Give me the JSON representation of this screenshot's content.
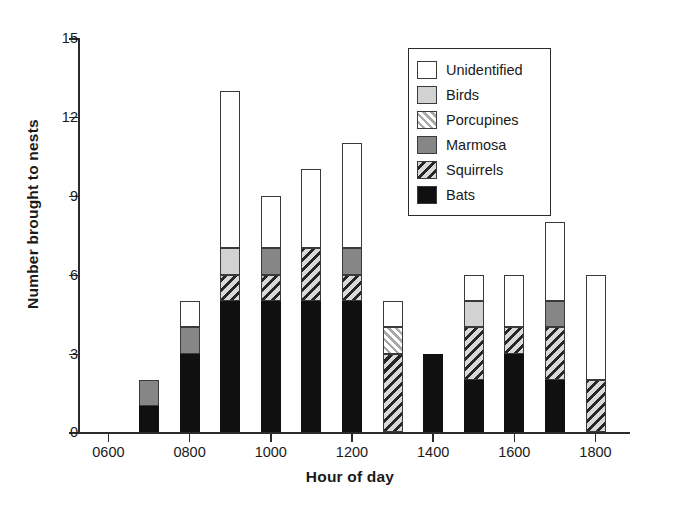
{
  "chart_data": {
    "type": "bar",
    "stacked": true,
    "title": "",
    "xlabel": "Hour of day",
    "ylabel": "Number brought to nests",
    "x": [
      "0600",
      "0700",
      "0800",
      "0900",
      "1000",
      "1100",
      "1200",
      "1300",
      "1400",
      "1500",
      "1600",
      "1700",
      "1800"
    ],
    "categories": [
      "0600",
      "0700",
      "0800",
      "0900",
      "1000",
      "1100",
      "1200",
      "1300",
      "1400",
      "1500",
      "1600",
      "1700",
      "1800"
    ],
    "xticks": [
      "0600",
      "0800",
      "1000",
      "1200",
      "1400",
      "1600",
      "1800"
    ],
    "yticks": [
      0,
      3,
      6,
      9,
      12,
      15
    ],
    "ylim": [
      0,
      15
    ],
    "grid": false,
    "legend_position": "upper-right",
    "series": [
      {
        "name": "Bats",
        "color": "#101010",
        "pattern": "solid",
        "values": [
          0,
          1,
          3,
          5,
          5,
          5,
          5,
          0,
          3,
          2,
          3,
          2,
          0
        ]
      },
      {
        "name": "Squirrels",
        "color": "#d6d6d6",
        "pattern": "hatch-back",
        "values": [
          0,
          0,
          0,
          1,
          1,
          2,
          1,
          3,
          0,
          2,
          1,
          2,
          2
        ]
      },
      {
        "name": "Marmosa",
        "color": "#868686",
        "pattern": "solid",
        "values": [
          0,
          1,
          1,
          0,
          1,
          0,
          1,
          0,
          0,
          0,
          0,
          1,
          0
        ]
      },
      {
        "name": "Porcupines",
        "color": "#e2e2e2",
        "pattern": "hatch-fwd",
        "values": [
          0,
          0,
          0,
          0,
          0,
          0,
          0,
          1,
          0,
          0,
          0,
          0,
          0
        ]
      },
      {
        "name": "Birds",
        "color": "#d2d2d2",
        "pattern": "solid",
        "values": [
          0,
          0,
          0,
          1,
          0,
          0,
          0,
          0,
          0,
          1,
          0,
          0,
          0
        ]
      },
      {
        "name": "Unidentified",
        "color": "#ffffff",
        "pattern": "solid",
        "values": [
          0,
          0,
          1,
          6,
          2,
          3,
          4,
          1,
          0,
          1,
          2,
          3,
          4
        ]
      }
    ],
    "totals": [
      0,
      2,
      5,
      13,
      9,
      10,
      11,
      5,
      3,
      6,
      6,
      8,
      6
    ]
  },
  "legend": {
    "items": [
      {
        "label": "Unidentified",
        "fill_class": "fill-unidentified"
      },
      {
        "label": "Birds",
        "fill_class": "fill-birds"
      },
      {
        "label": "Porcupines",
        "fill_class": "fill-porcupines"
      },
      {
        "label": "Marmosa",
        "fill_class": "fill-marmosa"
      },
      {
        "label": "Squirrels",
        "fill_class": "fill-squirrels"
      },
      {
        "label": "Bats",
        "fill_class": "fill-bats"
      }
    ]
  },
  "axes": {
    "ylabel": "Number brought to nests",
    "xlabel": "Hour of day"
  }
}
